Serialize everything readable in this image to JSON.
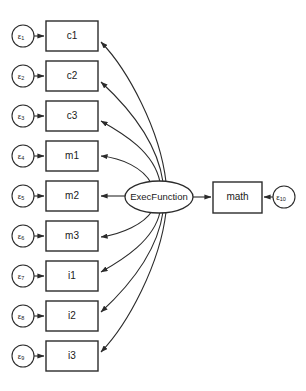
{
  "diagram": {
    "type": "sem-path-diagram",
    "title": "",
    "background_color": "#ffffff",
    "stroke_color": "#2b2b2b",
    "latent": {
      "id": "ExecFunction",
      "label": "ExecFunction",
      "shape": "ellipse",
      "cx": 159,
      "cy": 197,
      "rx": 34,
      "ry": 16
    },
    "outcome": {
      "id": "math",
      "label": "math",
      "shape": "rect",
      "x": 213,
      "y": 182,
      "width": 49,
      "height": 31
    },
    "indicators": [
      {
        "label": "c1",
        "x": 46,
        "y": 21,
        "width": 52,
        "height": 30,
        "cy": 36
      },
      {
        "label": "c2",
        "x": 46,
        "y": 61,
        "width": 52,
        "height": 30,
        "cy": 76
      },
      {
        "label": "c3",
        "x": 46,
        "y": 101,
        "width": 52,
        "height": 30,
        "cy": 116
      },
      {
        "label": "m1",
        "x": 46,
        "y": 141,
        "width": 52,
        "height": 30,
        "cy": 156
      },
      {
        "label": "m2",
        "x": 46,
        "y": 181,
        "width": 52,
        "height": 30,
        "cy": 196
      },
      {
        "label": "m3",
        "x": 46,
        "y": 221,
        "width": 52,
        "height": 30,
        "cy": 236
      },
      {
        "label": "i1",
        "x": 46,
        "y": 261,
        "width": 52,
        "height": 30,
        "cy": 276
      },
      {
        "label": "i2",
        "x": 46,
        "y": 301,
        "width": 52,
        "height": 30,
        "cy": 316
      },
      {
        "label": "i3",
        "x": 46,
        "y": 341,
        "width": 52,
        "height": 30,
        "cy": 356
      }
    ],
    "errors": [
      {
        "label": "ε",
        "subscript": "1",
        "cx": 23,
        "cy": 36,
        "r": 11,
        "target": "c1"
      },
      {
        "label": "ε",
        "subscript": "2",
        "cx": 23,
        "cy": 76,
        "r": 11,
        "target": "c2"
      },
      {
        "label": "ε",
        "subscript": "3",
        "cx": 23,
        "cy": 116,
        "r": 11,
        "target": "c3"
      },
      {
        "label": "ε",
        "subscript": "4",
        "cx": 23,
        "cy": 156,
        "r": 11,
        "target": "m1"
      },
      {
        "label": "ε",
        "subscript": "5",
        "cx": 23,
        "cy": 196,
        "r": 11,
        "target": "m2"
      },
      {
        "label": "ε",
        "subscript": "6",
        "cx": 23,
        "cy": 236,
        "r": 11,
        "target": "m3"
      },
      {
        "label": "ε",
        "subscript": "7",
        "cx": 23,
        "cy": 276,
        "r": 11,
        "target": "i1"
      },
      {
        "label": "ε",
        "subscript": "8",
        "cx": 23,
        "cy": 316,
        "r": 11,
        "target": "i2"
      },
      {
        "label": "ε",
        "subscript": "9",
        "cx": 23,
        "cy": 356,
        "r": 11,
        "target": "i3"
      },
      {
        "label": "ε",
        "subscript": "10",
        "cx": 284,
        "cy": 197,
        "r": 11,
        "target": "math"
      }
    ],
    "loadings": [
      {
        "from": "ExecFunction",
        "to": "c1"
      },
      {
        "from": "ExecFunction",
        "to": "c2"
      },
      {
        "from": "ExecFunction",
        "to": "c3"
      },
      {
        "from": "ExecFunction",
        "to": "m1"
      },
      {
        "from": "ExecFunction",
        "to": "m2"
      },
      {
        "from": "ExecFunction",
        "to": "m3"
      },
      {
        "from": "ExecFunction",
        "to": "i1"
      },
      {
        "from": "ExecFunction",
        "to": "i2"
      },
      {
        "from": "ExecFunction",
        "to": "i3"
      }
    ],
    "structural_path": {
      "from": "ExecFunction",
      "to": "math"
    }
  }
}
